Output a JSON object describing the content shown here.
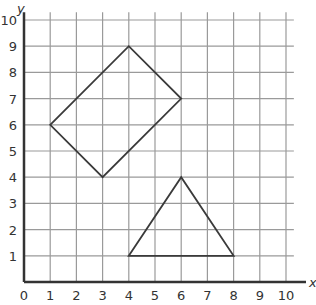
{
  "chart_data": {
    "type": "scatter",
    "title": "",
    "xlabel": "x",
    "ylabel": "y",
    "xlim": [
      0,
      10
    ],
    "ylim": [
      0,
      10
    ],
    "grid": true,
    "x_ticks": [
      "0",
      "1",
      "2",
      "3",
      "4",
      "5",
      "6",
      "7",
      "8",
      "9",
      "10"
    ],
    "y_ticks": [
      "1",
      "2",
      "3",
      "4",
      "5",
      "6",
      "7",
      "8",
      "9",
      "10"
    ],
    "shapes": [
      {
        "name": "quadrilateral",
        "vertices": [
          [
            1,
            6
          ],
          [
            4,
            9
          ],
          [
            6,
            7
          ],
          [
            3,
            4
          ]
        ]
      },
      {
        "name": "triangle",
        "vertices": [
          [
            4,
            1
          ],
          [
            6,
            4
          ],
          [
            8,
            1
          ]
        ]
      }
    ]
  },
  "colors": {
    "grid": "#9a9a9a",
    "axis": "#333333",
    "shape": "#3a3a3a"
  }
}
